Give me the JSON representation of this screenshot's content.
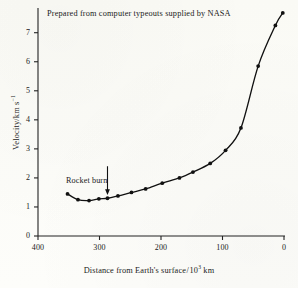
{
  "chart_data": {
    "type": "line",
    "title": "Prepared from computer typeouts supplied by NASA",
    "xlabel": "Distance from Earth's surface /10³ km",
    "ylabel": "Velocity/km s⁻¹",
    "xlabel_parts": {
      "main": "Distance from Earth's surface",
      "slash": "/",
      "base": "10",
      "exp": "3",
      "unit": " km"
    },
    "ylabel_parts": {
      "main": "Velocity/km s",
      "exp": "−1"
    },
    "xlim": [
      400,
      0
    ],
    "ylim": [
      0,
      7.7
    ],
    "x_reversed": true,
    "grid": false,
    "legend": "none",
    "xticks": [
      400,
      300,
      200,
      100,
      0
    ],
    "xtick_labels": [
      "400",
      "300",
      "200",
      "100",
      "0"
    ],
    "yticks": [
      0,
      1,
      2,
      3,
      4,
      5,
      6,
      7
    ],
    "ytick_labels": [
      "0",
      "1",
      "2",
      "3",
      "4",
      "5",
      "6",
      "7"
    ],
    "x": [
      352,
      335,
      317,
      301,
      287,
      270,
      248,
      225,
      202,
      172,
      145,
      122,
      104
    ],
    "values": [
      1.45,
      1.25,
      1.22,
      1.28,
      1.28,
      1.35,
      1.45,
      1.55,
      1.72,
      1.95,
      2.2,
      2.4,
      2.62
    ],
    "series": [
      {
        "name": "Spacecraft velocity",
        "points": [
          {
            "x": 352,
            "y": 1.45
          },
          {
            "x": 335,
            "y": 1.25
          },
          {
            "x": 317,
            "y": 1.22
          },
          {
            "x": 301,
            "y": 1.28
          },
          {
            "x": 287,
            "y": 1.3
          },
          {
            "x": 270,
            "y": 1.38
          },
          {
            "x": 248,
            "y": 1.5
          },
          {
            "x": 225,
            "y": 1.62
          },
          {
            "x": 198,
            "y": 1.82
          },
          {
            "x": 170,
            "y": 2.0
          },
          {
            "x": 148,
            "y": 2.2
          },
          {
            "x": 120,
            "y": 2.5
          },
          {
            "x": 95,
            "y": 2.95
          },
          {
            "x": 70,
            "y": 3.72
          },
          {
            "x": 42,
            "y": 5.85
          },
          {
            "x": 14,
            "y": 7.25
          },
          {
            "x": 2,
            "y": 7.68
          }
        ]
      }
    ],
    "annotations": [
      {
        "name": "rocket-burn",
        "text": "Rocket burn",
        "arrow": "down",
        "x": 287,
        "y": 1.3
      }
    ],
    "marker": "filled-circle",
    "line_color": "#111111",
    "marker_color": "#111111",
    "axis_color": "#222222",
    "background": "#fcfcfa"
  }
}
